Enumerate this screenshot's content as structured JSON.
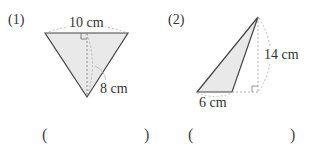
{
  "problems": [
    {
      "number": "(1)",
      "base_label": "10 cm",
      "height_label": "8 cm",
      "answer_open": "(",
      "answer_close": ")"
    },
    {
      "number": "(2)",
      "base_label": "6 cm",
      "height_label": "14 cm",
      "answer_open": "(",
      "answer_close": ")"
    }
  ],
  "colors": {
    "fill": "#e9e9e9",
    "stroke": "#444444",
    "dashed": "#999999"
  }
}
